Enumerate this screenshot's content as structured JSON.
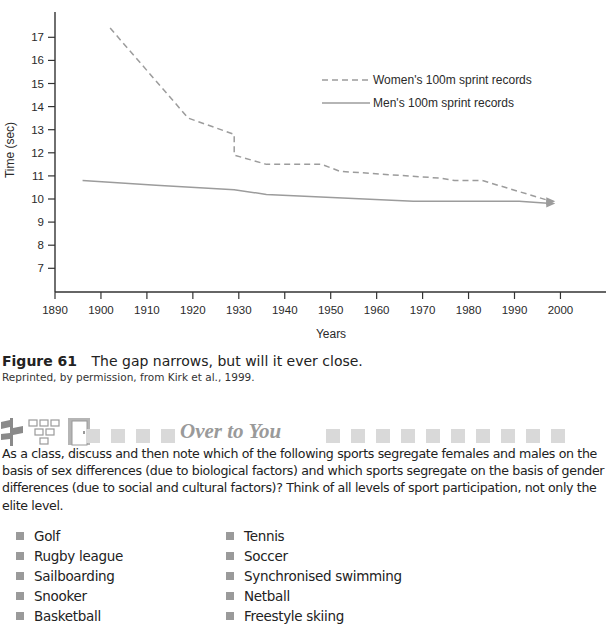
{
  "chart_data": {
    "type": "line",
    "title": "",
    "xlabel": "Years",
    "ylabel": "Time (sec)",
    "xlim": [
      1890,
      2010
    ],
    "ylim": [
      6,
      18
    ],
    "x_ticks": [
      "1890",
      "1900",
      "1910",
      "1920",
      "1930",
      "1940",
      "1950",
      "1960",
      "1970",
      "1980",
      "1990",
      "2000"
    ],
    "y_ticks": [
      "7",
      "8",
      "9",
      "10",
      "11",
      "12",
      "13",
      "14",
      "15",
      "16",
      "17"
    ],
    "grid": false,
    "legend_position": "upper right",
    "series": [
      {
        "name": "Women's 100m sprint records",
        "style": "dashed",
        "points": [
          [
            1902,
            17.4
          ],
          [
            1919,
            13.5
          ],
          [
            1929,
            12.8
          ],
          [
            1929,
            11.9
          ],
          [
            1936,
            11.5
          ],
          [
            1948,
            11.5
          ],
          [
            1952,
            11.2
          ],
          [
            1974,
            10.9
          ],
          [
            1977,
            10.8
          ],
          [
            1983,
            10.8
          ],
          [
            1998,
            9.9
          ]
        ]
      },
      {
        "name": "Men's 100m sprint records",
        "style": "solid",
        "points": [
          [
            1896,
            10.8
          ],
          [
            1912,
            10.6
          ],
          [
            1929,
            10.4
          ],
          [
            1936,
            10.2
          ],
          [
            1968,
            9.9
          ],
          [
            1991,
            9.9
          ],
          [
            1998,
            9.8
          ]
        ]
      }
    ]
  },
  "caption": {
    "figure_number": "Figure 61",
    "text": "The gap narrows, but will it ever close.",
    "credit": "Reprinted, by permission, from Kirk et al., 1999."
  },
  "section": {
    "title": "Over to You",
    "icons": [
      "signpost-icon",
      "org-chart-icon",
      "door-icon"
    ],
    "prompt": "As a class, discuss and then note which of the following sports segregate females and males on the basis of sex differences (due to biological factors) and which sports segregate on the basis of gender differences (due to social and cultural factors)? Think of all levels of sport participation, not only the elite level.",
    "list_left": [
      "Golf",
      "Rugby league",
      "Sailboarding",
      "Snooker",
      "Basketball"
    ],
    "list_right": [
      "Tennis",
      "Soccer",
      "Synchronised swimming",
      "Netball",
      "Freestyle skiing"
    ]
  },
  "colors": {
    "line": "#9c9c9c",
    "axis": "#333333",
    "section_title": "#9a9a9a",
    "decor_square": "#d9d9d9",
    "bullet": "#9a9a9a"
  }
}
